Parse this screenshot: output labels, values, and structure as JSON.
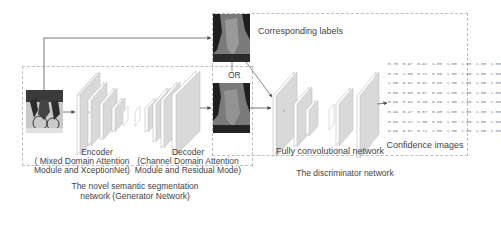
{
  "diagram": {
    "input_image": {
      "description": "photo of cyclists (input image)"
    },
    "labels": {
      "corresponding_labels": "Corresponding labels",
      "or": "OR",
      "encoder_title": "Encoder",
      "encoder_sub1": "( Mixed Domain Attention",
      "encoder_sub2": "Module and XceptionNet)",
      "decoder_title": "Decoder",
      "decoder_sub1": "(Channel Domain Attention",
      "decoder_sub2": "Module and Residual Mode)",
      "fcn": "Fully convolutional network",
      "confidence": "Confidence images",
      "generator_1": "The novel semantic segmentation",
      "generator_2": "network (Generator Network)",
      "discriminator": "The discriminator network"
    },
    "confidence_matrix": [
      [
        "0.70",
        "0.97",
        "0.92",
        "1.00",
        "1.00",
        "1.00",
        "1.00",
        "1.00"
      ],
      [
        "0.79",
        "1.00",
        "0.71",
        "0.99",
        "1.00",
        "1.00",
        "1.00",
        "1.00"
      ],
      [
        "1.00",
        "0.91",
        "0.92",
        "0.98",
        "1.00",
        "1.00",
        "1.00",
        "1.00"
      ],
      [
        "0.89",
        "0.98",
        "0.57",
        "0.99",
        "1.00",
        "1.00",
        "1.00",
        "1.00"
      ],
      [
        "0.99",
        "0.94",
        "0.45",
        "0.99",
        "1.00",
        "1.00",
        "1.00",
        "1.00"
      ],
      [
        "0.99",
        "0.47",
        "0.87",
        "0.98",
        "1.00",
        "1.00",
        "1.00",
        "1.00"
      ],
      [
        "0.99",
        "0.47",
        "1.00",
        "0.99",
        "1.00",
        "1.00",
        "1.00",
        "1.00"
      ],
      [
        "0.99",
        "0.87",
        "0.71",
        "1.00",
        "1.00",
        "1.00",
        "1.00",
        "1.00"
      ]
    ],
    "colors": {
      "line": "#555555",
      "dash": "#bdbdbd",
      "layer_face": "#ffffff",
      "layer_side": "#d9d9d9",
      "seg_dark": "#1e1e1e",
      "seg_gray": "#7a7a7a"
    }
  }
}
